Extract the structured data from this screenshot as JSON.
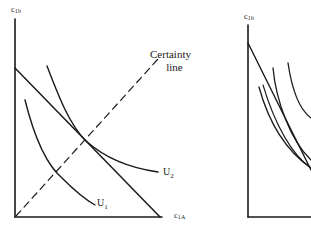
{
  "left_panel": {
    "y_axis_label": {
      "base": "c",
      "sub": "1b"
    },
    "x_axis_label": {
      "base": "c",
      "sub": "1A"
    },
    "certainty_line_label": [
      "Certainty",
      "line"
    ],
    "curves": [
      {
        "id": "U1",
        "label": {
          "base": "U",
          "sub": "1"
        }
      },
      {
        "id": "U2",
        "label": {
          "base": "U",
          "sub": "2"
        }
      }
    ],
    "budget_line": "straight budget line from y-axis to x-axis",
    "certainty_line_style": "dashed"
  },
  "right_panel": {
    "y_axis_label": {
      "base": "c",
      "sub": "1b"
    },
    "curves_count": 4
  },
  "colors": {
    "ink": "#1a1a1a",
    "background": "#ffffff"
  }
}
